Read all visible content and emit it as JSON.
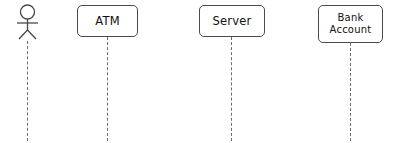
{
  "diagram": {
    "type": "uml-sequence-diagram",
    "width": 397,
    "height": 143,
    "background_color": "#ffffff",
    "line_color": "#4a4a4a",
    "lifeline_color": "#6e6e6e",
    "text_color": "#111111"
  },
  "participants": [
    {
      "id": "actor",
      "kind": "actor",
      "label": "",
      "icon": "stick-figure-actor-icon",
      "lifeline_x": 27,
      "has_lifeline": true
    },
    {
      "id": "atm",
      "kind": "object-box",
      "label": "ATM",
      "lifeline_x": 107,
      "has_lifeline": true
    },
    {
      "id": "server",
      "kind": "object-box",
      "label": "Server",
      "lifeline_x": 231,
      "has_lifeline": true
    },
    {
      "id": "bank_account",
      "kind": "object-box",
      "label": "Bank\nAccount",
      "label_line1": "Bank",
      "label_line2": "Account",
      "lifeline_x": 350,
      "has_lifeline": true
    }
  ],
  "messages": []
}
